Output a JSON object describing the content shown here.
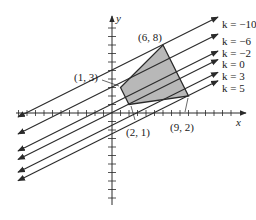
{
  "diagram": {
    "axes": {
      "x_label": "x",
      "y_label": "y"
    },
    "region": {
      "fill": "#b8b8b8",
      "vertices": [
        {
          "x": 1,
          "y": 3,
          "label": "(1, 3)"
        },
        {
          "x": 6,
          "y": 8,
          "label": "(6, 8)"
        },
        {
          "x": 9,
          "y": 2,
          "label": "(9, 2)"
        },
        {
          "x": 2,
          "y": 1,
          "label": "(2, 1)"
        }
      ]
    },
    "level_lines": {
      "equation": "x - 2y = k",
      "items": [
        {
          "k": -10,
          "label": "k = −10"
        },
        {
          "k": -6,
          "label": "k = −6"
        },
        {
          "k": -2,
          "label": "k = −2"
        },
        {
          "k": 0,
          "label": "k = 0"
        },
        {
          "k": 3,
          "label": "k = 3"
        },
        {
          "k": 5,
          "label": "k = 5"
        }
      ]
    },
    "colors": {
      "line": "#2a2a2a",
      "region": "#b8b8b8"
    }
  }
}
